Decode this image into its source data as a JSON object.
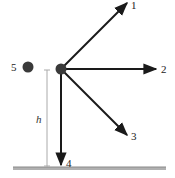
{
  "diagram": {
    "colors": {
      "arrow": "#1a1a1a",
      "ball": "#333333",
      "ground": "#9a9a9a",
      "height_marker": "#aaaaaa"
    },
    "launch_point": {
      "x": 61,
      "y": 69
    },
    "arrows": [
      {
        "id": "1",
        "label": "1",
        "direction": "up-right 45deg"
      },
      {
        "id": "2",
        "label": "2",
        "direction": "horizontal right"
      },
      {
        "id": "3",
        "label": "3",
        "direction": "down-right 45deg"
      },
      {
        "id": "4",
        "label": "4",
        "direction": "straight down"
      }
    ],
    "ball5": {
      "label": "5",
      "description": "ball released from rest"
    },
    "height_label": "h"
  }
}
